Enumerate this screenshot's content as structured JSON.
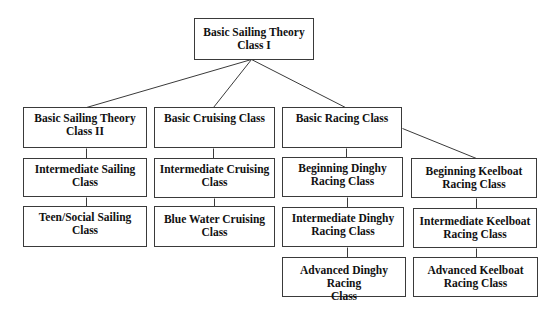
{
  "diagram": {
    "type": "hierarchy",
    "root": {
      "id": "bst1",
      "label": "Basic Sailing Theory Class I"
    },
    "nodes": [
      {
        "id": "bst1",
        "label": "Basic Sailing Theory\nClass I",
        "x": 194,
        "y": 18,
        "w": 120,
        "h": 42
      },
      {
        "id": "bst2",
        "label": "Basic Sailing Theory\nClass II",
        "x": 23,
        "y": 107,
        "w": 124,
        "h": 41
      },
      {
        "id": "bcc",
        "label": "Basic Cruising Class",
        "x": 154,
        "y": 107,
        "w": 121,
        "h": 41
      },
      {
        "id": "brc",
        "label": "Basic Racing Class",
        "x": 282,
        "y": 107,
        "w": 120,
        "h": 41
      },
      {
        "id": "isc",
        "label": "Intermediate Sailing\nClass",
        "x": 23,
        "y": 158,
        "w": 124,
        "h": 39
      },
      {
        "id": "icc",
        "label": "Intermediate Cruising\nClass",
        "x": 154,
        "y": 158,
        "w": 121,
        "h": 40
      },
      {
        "id": "bdrc",
        "label": "Beginning Dinghy\nRacing Class",
        "x": 282,
        "y": 157,
        "w": 121,
        "h": 40
      },
      {
        "id": "bkrc",
        "label": "Beginning Keelboat\nRacing Class",
        "x": 411,
        "y": 158,
        "w": 126,
        "h": 40
      },
      {
        "id": "tssc",
        "label": "Teen/Social Sailing\nClass",
        "x": 23,
        "y": 206,
        "w": 124,
        "h": 41
      },
      {
        "id": "bwcc",
        "label": "Blue Water Cruising\nClass",
        "x": 154,
        "y": 206,
        "w": 121,
        "h": 41
      },
      {
        "id": "idrc",
        "label": "Intermediate Dinghy\nRacing Class",
        "x": 282,
        "y": 207,
        "w": 122,
        "h": 40
      },
      {
        "id": "ikrc",
        "label": "Intermediate Keelboat\nRacing Class",
        "x": 413,
        "y": 208,
        "w": 124,
        "h": 40
      },
      {
        "id": "adrc",
        "label": "Advanced Dinghy Racing\nClass",
        "x": 282,
        "y": 257,
        "w": 124,
        "h": 40
      },
      {
        "id": "akrc",
        "label": "Advanced Keelboat\nRacing Class",
        "x": 413,
        "y": 257,
        "w": 125,
        "h": 40
      }
    ],
    "edges": [
      {
        "from": "bst1",
        "to": "bst2",
        "x1": 251,
        "y1": 59,
        "x2": 86,
        "y2": 107
      },
      {
        "from": "bst1",
        "to": "bcc",
        "x1": 251,
        "y1": 59,
        "x2": 213,
        "y2": 107
      },
      {
        "from": "bst1",
        "to": "brc",
        "x1": 251,
        "y1": 59,
        "x2": 345,
        "y2": 107
      },
      {
        "from": "bst2",
        "to": "isc",
        "x1": 86,
        "y1": 148,
        "x2": 86,
        "y2": 158
      },
      {
        "from": "isc",
        "to": "tssc",
        "x1": 86,
        "y1": 197,
        "x2": 86,
        "y2": 206
      },
      {
        "from": "bcc",
        "to": "icc",
        "x1": 213,
        "y1": 148,
        "x2": 213,
        "y2": 158
      },
      {
        "from": "icc",
        "to": "bwcc",
        "x1": 214,
        "y1": 198,
        "x2": 214,
        "y2": 206
      },
      {
        "from": "brc",
        "to": "bdrc",
        "x1": 346,
        "y1": 148,
        "x2": 346,
        "y2": 157
      },
      {
        "from": "brc",
        "to": "bkrc",
        "x1": 402,
        "y1": 128,
        "x2": 476,
        "y2": 158
      },
      {
        "from": "bdrc",
        "to": "idrc",
        "x1": 347,
        "y1": 197,
        "x2": 347,
        "y2": 207
      },
      {
        "from": "idrc",
        "to": "adrc",
        "x1": 347,
        "y1": 247,
        "x2": 347,
        "y2": 257
      },
      {
        "from": "bkrc",
        "to": "ikrc",
        "x1": 476,
        "y1": 198,
        "x2": 476,
        "y2": 208
      },
      {
        "from": "ikrc",
        "to": "akrc",
        "x1": 476,
        "y1": 248,
        "x2": 476,
        "y2": 257
      }
    ]
  },
  "labels": {
    "bst1": [
      "Basic Sailing Theory",
      "Class I"
    ],
    "bst2": [
      "Basic Sailing Theory",
      "Class II"
    ],
    "bcc": [
      "Basic Cruising Class"
    ],
    "brc": [
      "Basic Racing Class"
    ],
    "isc": [
      "Intermediate Sailing",
      "Class"
    ],
    "icc": [
      "Intermediate Cruising",
      "Class"
    ],
    "bdrc": [
      "Beginning Dinghy",
      "Racing Class"
    ],
    "bkrc": [
      "Beginning Keelboat",
      "Racing Class"
    ],
    "tssc": [
      "Teen/Social Sailing",
      "Class"
    ],
    "bwcc": [
      "Blue Water Cruising",
      "Class"
    ],
    "idrc": [
      "Intermediate Dinghy",
      "Racing Class"
    ],
    "ikrc": [
      "Intermediate Keelboat",
      "Racing Class"
    ],
    "adrc": [
      "Advanced Dinghy Racing",
      "Class"
    ],
    "akrc": [
      "Advanced Keelboat",
      "Racing Class"
    ]
  }
}
